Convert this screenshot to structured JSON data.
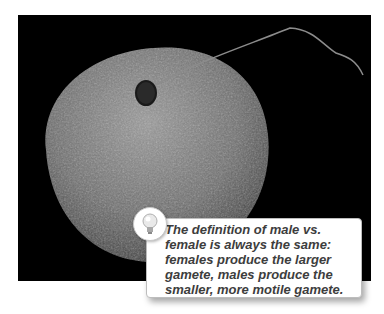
{
  "figure": {
    "photo_description": "Scanning electron micrograph of a sperm cell attached to a large egg cell on a black background",
    "colors": {
      "background": "#000000",
      "egg": "#7a7a7a",
      "callout_border": "#bdbdbd",
      "text": "#3d3d3d"
    }
  },
  "callout": {
    "icon": "lightbulb-icon",
    "text_lines": [
      "The definition of male vs.",
      "female is always the same:",
      "females produce the larger",
      "gamete, males produce the",
      "smaller, more motile gamete."
    ]
  }
}
